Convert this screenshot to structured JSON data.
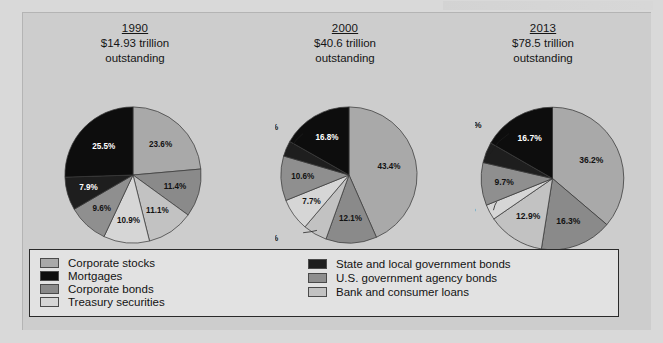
{
  "colors": {
    "page_background": "#d9d9d9",
    "panel_background": "#cdcdcd",
    "legend_background": "#e2e2e2",
    "legend_border": "#2a2a2a",
    "slice_outline": "#3a3a3a",
    "corporate_stocks": "#a9a9a9",
    "mortgages": "#0d0d0d",
    "corporate_bonds": "#8a8a8a",
    "treasury_securities": "#d6d6d6",
    "state_local_government_bonds": "#1e1e1e",
    "us_government_agency_bonds": "#8f8f8f",
    "bank_and_consumer_loans": "#c2c2c2"
  },
  "legend": {
    "left_column": [
      {
        "label": "Corporate stocks",
        "key": "corporate_stocks",
        "swatch": "#a9a9a9"
      },
      {
        "label": "Mortgages",
        "key": "mortgages",
        "swatch": "#0d0d0d"
      },
      {
        "label": "Corporate bonds",
        "key": "corporate_bonds",
        "swatch": "#8a8a8a"
      },
      {
        "label": "Treasury securities",
        "key": "treasury_securities",
        "swatch": "#d6d6d6"
      }
    ],
    "right_column": [
      {
        "label": "State and local government bonds",
        "key": "state_local_government_bonds",
        "swatch": "#1e1e1e"
      },
      {
        "label": "U.S. government agency bonds",
        "key": "us_government_agency_bonds",
        "swatch": "#8f8f8f"
      },
      {
        "label": "Bank and consumer loans",
        "key": "bank_and_consumer_loans",
        "swatch": "#c2c2c2"
      }
    ]
  },
  "columns": [
    {
      "year": "1990",
      "amount": "$14.93 trillion",
      "outstanding": "outstanding"
    },
    {
      "year": "2000",
      "amount": "$40.6 trillion",
      "outstanding": "outstanding"
    },
    {
      "year": "2013",
      "amount": "$78.5 trillion",
      "outstanding": "outstanding"
    }
  ],
  "chart_data": [
    {
      "type": "pie",
      "title": "1990",
      "subtitle": "$14.93 trillion outstanding",
      "start_angle_deg": 0,
      "direction": "clockwise",
      "labels": [
        "Corporate stocks",
        "Corporate bonds",
        "Treasury securities",
        "Bank and consumer loans",
        "U.S. government agency bonds",
        "State and local government bonds",
        "Mortgages"
      ],
      "values": [
        23.6,
        11.4,
        11.1,
        10.9,
        9.6,
        7.9,
        25.5
      ],
      "value_labels": [
        "23.6%",
        "11.4%",
        "11.1%",
        "10.9%",
        "9.6%",
        "7.9%",
        "25.5%"
      ],
      "colors": [
        "#a9a9a9",
        "#8a8a8a",
        "#c2c2c2",
        "#d6d6d6",
        "#8f8f8f",
        "#1e1e1e",
        "#0d0d0d"
      ],
      "label_placement": [
        "inside",
        "inside",
        "inside",
        "inside",
        "inside",
        "inside",
        "inside"
      ],
      "total": 100.0
    },
    {
      "type": "pie",
      "title": "2000",
      "subtitle": "$40.6 trillion outstanding",
      "start_angle_deg": 0,
      "direction": "clockwise",
      "labels": [
        "Corporate stocks",
        "Corporate bonds",
        "Treasury securities",
        "Bank and consumer loans",
        "U.S. government agency bonds",
        "State and local government bonds",
        "Mortgages"
      ],
      "values": [
        43.4,
        12.1,
        5.7,
        7.7,
        10.6,
        3.7,
        16.8
      ],
      "value_labels": [
        "43.4%",
        "12.1%",
        "5.7%",
        "7.7%",
        "10.6%",
        "3.7%",
        "16.8%"
      ],
      "colors": [
        "#a9a9a9",
        "#8a8a8a",
        "#c2c2c2",
        "#d6d6d6",
        "#8f8f8f",
        "#1e1e1e",
        "#0d0d0d"
      ],
      "label_placement": [
        "inside",
        "inside",
        "callout",
        "inside",
        "inside",
        "callout",
        "inside"
      ],
      "total": 100.0
    },
    {
      "type": "pie",
      "title": "2013",
      "subtitle": "$78.5 trillion outstanding",
      "start_angle_deg": 0,
      "direction": "clockwise",
      "labels": [
        "Corporate stocks",
        "Corporate bonds",
        "Treasury securities",
        "Bank and consumer loans",
        "U.S. government agency bonds",
        "State and local government bonds",
        "Mortgages"
      ],
      "values": [
        36.2,
        16.3,
        12.9,
        3.5,
        9.7,
        4.7,
        16.7
      ],
      "value_labels": [
        "36.2%",
        "16.3%",
        "12.9%",
        "3.5%",
        "9.7%",
        "4.7%",
        "16.7%"
      ],
      "colors": [
        "#a9a9a9",
        "#8a8a8a",
        "#c2c2c2",
        "#d6d6d6",
        "#8f8f8f",
        "#1e1e1e",
        "#0d0d0d"
      ],
      "label_placement": [
        "inside",
        "inside",
        "inside",
        "callout",
        "inside",
        "callout",
        "inside"
      ],
      "total": 100.0
    }
  ]
}
